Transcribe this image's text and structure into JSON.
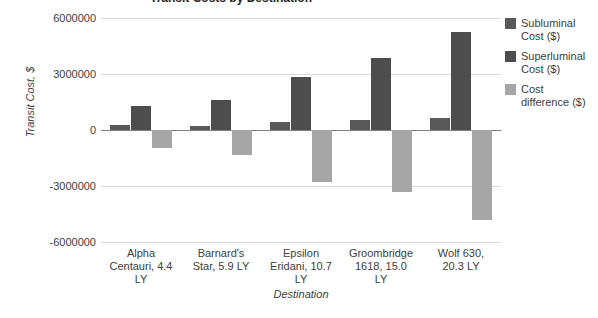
{
  "chart_data": {
    "type": "bar",
    "title": "Transit Costs by Destination",
    "xlabel": "Destination",
    "ylabel": "Transit Cost, $",
    "ylim": [
      -6000000,
      6000000
    ],
    "ytick_labels": [
      "6000000",
      "3000000",
      "0",
      "-3000000",
      "-6000000"
    ],
    "ytick_values": [
      6000000,
      3000000,
      0,
      -3000000,
      -6000000
    ],
    "grid": true,
    "legend_position": "right",
    "categories": [
      "Alpha Centauri, 4.4 LY",
      "Barnard's Star, 5.9 LY",
      "Epsilon Eridani, 10.7 LY",
      "Groombridge 1618, 15.0 LY",
      "Wolf 630, 20.3 LY"
    ],
    "series": [
      {
        "name": "Subluminal Cost ($)",
        "color": "#595959",
        "values": [
          270000,
          230000,
          430000,
          540000,
          650000
        ]
      },
      {
        "name": "Superluminal Cost ($)",
        "color": "#4d4d4d",
        "values": [
          1290000,
          1610000,
          2840000,
          3860000,
          5250000
        ]
      },
      {
        "name": "Cost difference ($)",
        "color": "#a6a6a6",
        "values": [
          -960000,
          -1340000,
          -2790000,
          -3320000,
          -4820000
        ]
      }
    ]
  },
  "legend": {
    "items": [
      {
        "label_line1": "Subluminal",
        "label_line2": "Cost ($)",
        "color": "#595959"
      },
      {
        "label_line1": "Superluminal",
        "label_line2": "Cost ($)",
        "color": "#4d4d4d"
      },
      {
        "label_line1": "Cost",
        "label_line2": "difference ($)",
        "color": "#a6a6a6"
      }
    ]
  },
  "x_labels": [
    {
      "line1": "Alpha",
      "line2": "Centauri, 4.4",
      "line3": "LY"
    },
    {
      "line1": "Barnard's",
      "line2": "Star, 5.9 LY",
      "line3": ""
    },
    {
      "line1": "Epsilon",
      "line2": "Eridani, 10.7",
      "line3": "LY"
    },
    {
      "line1": "Groombridge",
      "line2": "1618, 15.0",
      "line3": "LY"
    },
    {
      "line1": "Wolf 630,",
      "line2": "20.3 LY",
      "line3": ""
    }
  ]
}
